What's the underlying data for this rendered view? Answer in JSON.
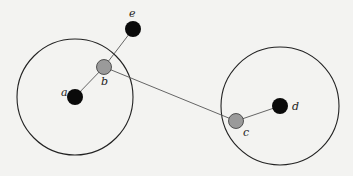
{
  "diagram": {
    "width": 353,
    "height": 176,
    "colors": {
      "background": "#f3f3f1",
      "circle_stroke": "#222222",
      "edge_stroke": "#555555",
      "node_black": "#0a0a0a",
      "node_gray": "#9a9a9a"
    },
    "circles": [
      {
        "id": "left-range",
        "cx": 75,
        "cy": 97,
        "r": 58
      },
      {
        "id": "right-range",
        "cx": 280,
        "cy": 106,
        "r": 59
      }
    ],
    "nodes": [
      {
        "id": "a",
        "label": "a",
        "x": 75,
        "y": 97,
        "r": 8,
        "fill": "black",
        "label_x": 61,
        "label_y": 96
      },
      {
        "id": "b",
        "label": "b",
        "x": 104,
        "y": 67,
        "r": 7.5,
        "fill": "gray",
        "label_x": 101,
        "label_y": 85
      },
      {
        "id": "e",
        "label": "e",
        "x": 133,
        "y": 29,
        "r": 8,
        "fill": "black",
        "label_x": 129,
        "label_y": 17
      },
      {
        "id": "c",
        "label": "c",
        "x": 236,
        "y": 121,
        "r": 7.5,
        "fill": "gray",
        "label_x": 243,
        "label_y": 136
      },
      {
        "id": "d",
        "label": "d",
        "x": 280,
        "y": 106,
        "r": 8,
        "fill": "black",
        "label_x": 292,
        "label_y": 110
      }
    ],
    "edges": [
      {
        "from": "a",
        "to": "b"
      },
      {
        "from": "b",
        "to": "e"
      },
      {
        "from": "b",
        "to": "c"
      },
      {
        "from": "c",
        "to": "d"
      }
    ]
  }
}
